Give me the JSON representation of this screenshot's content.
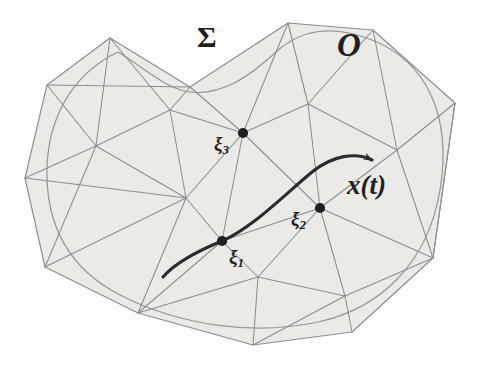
{
  "figure": {
    "caption_none": "",
    "domain_label": "Σ",
    "region_label": "O",
    "trajectory_label": "x(t)",
    "nodes": [
      {
        "name": "xi1",
        "base": "ξ",
        "sub": "1",
        "x": 222,
        "y": 241,
        "label_x": 229,
        "label_y": 247
      },
      {
        "name": "xi2",
        "base": "ξ",
        "sub": "2",
        "x": 320,
        "y": 208,
        "label_x": 291,
        "label_y": 209
      },
      {
        "name": "xi3",
        "base": "ξ",
        "sub": "3",
        "x": 243,
        "y": 133,
        "label_x": 214,
        "label_y": 134
      }
    ],
    "labels": {
      "sigma": {
        "text": "Σ",
        "x": 197,
        "y": 22
      },
      "region": {
        "text": "O",
        "x": 337,
        "y": 29
      },
      "trajectory": {
        "text": "x(t)",
        "x": 347,
        "y": 172
      }
    },
    "colors": {
      "background": "#fdfdfc",
      "surface_fill": "#ebeae7",
      "mesh_line": "#8d8d8d",
      "outline": "#9a9a9a",
      "trajectory": "#2b2b2b",
      "node": "#1f1f1f",
      "label": "#1f1f1f"
    },
    "geometry": {
      "polygon_vertices": [
        [
          110,
          38
        ],
        [
          47,
          85
        ],
        [
          25,
          178
        ],
        [
          45,
          267
        ],
        [
          138,
          313
        ],
        [
          253,
          345
        ],
        [
          352,
          332
        ],
        [
          433,
          258
        ],
        [
          455,
          103
        ],
        [
          373,
          30
        ],
        [
          288,
          23
        ],
        [
          190,
          87
        ]
      ],
      "smooth_outline": "closed freeform blob with concave notch at top center",
      "interior_nodes": [
        [
          96,
          146
        ],
        [
          170,
          110
        ],
        [
          186,
          198
        ],
        [
          222,
          241
        ],
        [
          243,
          133
        ],
        [
          320,
          208
        ],
        [
          308,
          104
        ],
        [
          397,
          150
        ],
        [
          258,
          277
        ],
        [
          345,
          296
        ]
      ],
      "trajectory_path": {
        "start": [
          163,
          277
        ],
        "through": [
          222,
          241
        ],
        "apex": [
          312,
          160
        ],
        "arrow_tip": [
          376,
          163
        ]
      }
    }
  }
}
